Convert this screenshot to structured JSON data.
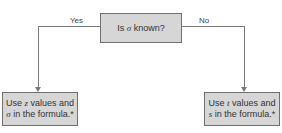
{
  "decision": {
    "pre": "Is ",
    "symbol": "σ",
    "post": " known?"
  },
  "branches": {
    "yes_label": "Yes",
    "no_label": "No"
  },
  "left_box": {
    "line1_pre": "Use ",
    "line1_var": "z",
    "line1_post": " values and",
    "line2_var": "σ",
    "line2_post": " in the formula.*"
  },
  "right_box": {
    "line1_pre": "Use ",
    "line1_var": "t",
    "line1_post": " values and",
    "line2_var": "s",
    "line2_post": " in the formula.*"
  },
  "colors": {
    "box_fill": "#d6d6d6",
    "box_border": "#6f6f6f",
    "line": "#7a7a7a"
  }
}
